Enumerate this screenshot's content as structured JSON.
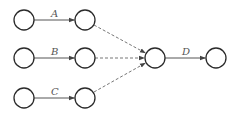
{
  "diagram": {
    "type": "activity-on-arrow network",
    "nodes": [
      {
        "id": "n1",
        "cx": 24,
        "cy": 20
      },
      {
        "id": "n2",
        "cx": 85,
        "cy": 20
      },
      {
        "id": "n3",
        "cx": 24,
        "cy": 58
      },
      {
        "id": "n4",
        "cx": 85,
        "cy": 58
      },
      {
        "id": "n5",
        "cx": 24,
        "cy": 98
      },
      {
        "id": "n6",
        "cx": 85,
        "cy": 98
      },
      {
        "id": "n7",
        "cx": 155,
        "cy": 58
      },
      {
        "id": "n8",
        "cx": 216,
        "cy": 58
      }
    ],
    "activities": [
      {
        "label": "A",
        "from": "n1",
        "to": "n2",
        "style": "solid"
      },
      {
        "label": "B",
        "from": "n3",
        "to": "n4",
        "style": "solid"
      },
      {
        "label": "C",
        "from": "n5",
        "to": "n6",
        "style": "solid"
      },
      {
        "label": "D",
        "from": "n7",
        "to": "n8",
        "style": "solid"
      }
    ],
    "dummy_activities": [
      {
        "from": "n2",
        "to": "n7",
        "style": "dashed"
      },
      {
        "from": "n4",
        "to": "n7",
        "style": "dashed"
      },
      {
        "from": "n6",
        "to": "n7",
        "style": "dashed"
      }
    ],
    "labels": {
      "a": "A",
      "b": "B",
      "c": "C",
      "d": "D"
    }
  }
}
